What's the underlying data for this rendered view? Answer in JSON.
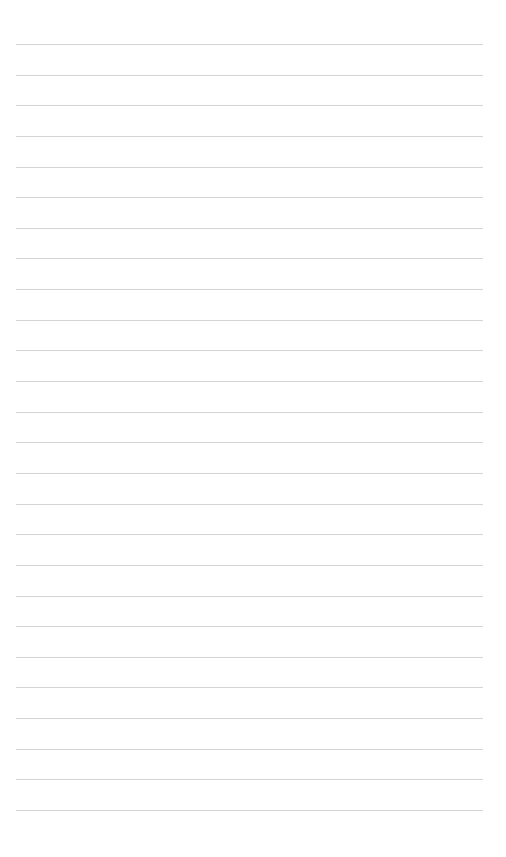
{
  "page": {
    "type": "lined-paper",
    "background_color": "#ffffff",
    "line_color": "#d4d4d4",
    "line_count": 26,
    "first_line_y": 44,
    "line_spacing": 30.64,
    "line_left": 16,
    "line_width": 467
  }
}
